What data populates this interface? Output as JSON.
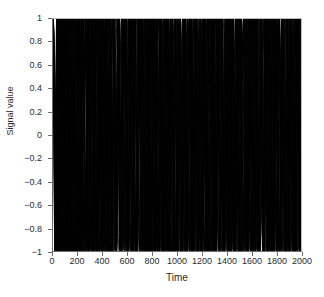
{
  "chart_data": {
    "type": "line",
    "title": "",
    "subtitle": "",
    "xlabel": "Time",
    "ylabel": "Signal value",
    "xlim": [
      0,
      2000
    ],
    "ylim": [
      -1,
      1
    ],
    "xticks": [
      0,
      200,
      400,
      600,
      800,
      1000,
      1200,
      1400,
      1600,
      1800,
      2000
    ],
    "xtick_labels": [
      "0",
      "200",
      "400",
      "600",
      "800",
      "1000",
      "1200",
      "1400",
      "1600",
      "1800",
      "2000"
    ],
    "yticks": [
      1,
      0.8,
      0.6,
      0.4,
      0.2,
      0,
      -0.2,
      -0.4,
      -0.6,
      -0.8,
      -1
    ],
    "ytick_labels": [
      "1",
      "0.8",
      "0.6",
      "0.4",
      "0.2",
      "0",
      "-0.2",
      "-0.4",
      "-0.6",
      "-0.8",
      "-1"
    ],
    "grid": false,
    "legend": false,
    "legend_position": "none",
    "line_color": "#000000",
    "line_width": 0.8,
    "background_color": "#ffffff",
    "axis_color": "#6e6e6e",
    "n_points": 2001,
    "series": [
      {
        "name": "signal-1",
        "waveform": "cosine",
        "amplitude": 1,
        "period": 101,
        "phase": 0
      },
      {
        "name": "signal-2",
        "waveform": "cosine",
        "amplitude": 1,
        "period": 89,
        "phase": 0
      },
      {
        "name": "signal-3",
        "waveform": "cosine",
        "amplitude": 1,
        "period": 79,
        "phase": 0
      },
      {
        "name": "signal-4",
        "waveform": "cosine",
        "amplitude": 1,
        "period": 71,
        "phase": 0
      },
      {
        "name": "signal-5",
        "waveform": "cosine",
        "amplitude": 1,
        "period": 64,
        "phase": 0
      },
      {
        "name": "signal-6",
        "waveform": "cosine",
        "amplitude": 1,
        "period": 58,
        "phase": 0
      },
      {
        "name": "signal-7",
        "waveform": "cosine",
        "amplitude": 1,
        "period": 53,
        "phase": 0
      },
      {
        "name": "signal-8",
        "waveform": "cosine",
        "amplitude": 1,
        "period": 48,
        "phase": 0
      },
      {
        "name": "signal-9",
        "waveform": "cosine",
        "amplitude": 1,
        "period": 44,
        "phase": 0
      },
      {
        "name": "signal-10",
        "waveform": "cosine",
        "amplitude": 1,
        "period": 41,
        "phase": 0
      },
      {
        "name": "signal-11",
        "waveform": "cosine",
        "amplitude": 1,
        "period": 38,
        "phase": 0
      },
      {
        "name": "signal-12",
        "waveform": "cosine",
        "amplitude": 1,
        "period": 35,
        "phase": 0
      },
      {
        "name": "signal-13",
        "waveform": "cosine",
        "amplitude": 1,
        "period": 33,
        "phase": 0
      },
      {
        "name": "signal-14",
        "waveform": "cosine",
        "amplitude": 1,
        "period": 31,
        "phase": 0
      },
      {
        "name": "signal-15",
        "waveform": "cosine",
        "amplitude": 1,
        "period": 29,
        "phase": 0
      }
    ]
  }
}
